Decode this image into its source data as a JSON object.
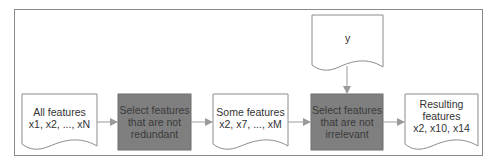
{
  "diagram": {
    "type": "flowchart",
    "colors": {
      "border": "#8a8a8a",
      "process_fill": "#7f7f7f",
      "doc_stroke": "#8c8c8c",
      "arrow": "#9a9a9a",
      "text": "#333333"
    },
    "nodes": [
      {
        "id": "all_features",
        "shape": "document",
        "lines": [
          "All features",
          "x1, x2, ..., xN"
        ]
      },
      {
        "id": "remove_redundant",
        "shape": "process",
        "lines": [
          "Select features",
          "that are not",
          "redundant"
        ]
      },
      {
        "id": "some_features",
        "shape": "document",
        "lines": [
          "Some features",
          "x2, x7, ..., xM"
        ]
      },
      {
        "id": "target",
        "shape": "document",
        "lines": [
          "y"
        ]
      },
      {
        "id": "remove_irrelevant",
        "shape": "process",
        "lines": [
          "Select features",
          "that are not",
          "irrelevant"
        ]
      },
      {
        "id": "resulting_features",
        "shape": "document",
        "lines": [
          "Resulting",
          "features",
          "x2, x10, x14"
        ]
      }
    ],
    "edges": [
      {
        "from": "all_features",
        "to": "remove_redundant"
      },
      {
        "from": "remove_redundant",
        "to": "some_features"
      },
      {
        "from": "some_features",
        "to": "remove_irrelevant"
      },
      {
        "from": "target",
        "to": "remove_irrelevant"
      },
      {
        "from": "remove_irrelevant",
        "to": "resulting_features"
      }
    ]
  }
}
